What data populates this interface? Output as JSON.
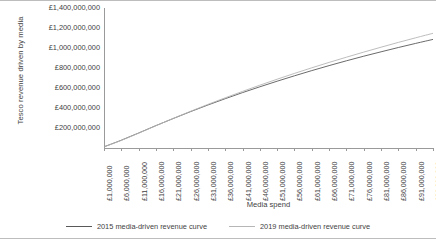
{
  "chart_data": {
    "type": "line",
    "title": "",
    "xlabel": "Media spend",
    "ylabel": "Tesco revenue driven by media",
    "grid": false,
    "legend_position": "bottom",
    "xlim": [
      1000000,
      96000000
    ],
    "ylim": [
      0,
      1400000000
    ],
    "x_tick_labels": [
      "£1,000,000",
      "£6,000,000",
      "£11,000,000",
      "£16,000,000",
      "£21,000,000",
      "£26,000,000",
      "£31,000,000",
      "£36,000,000",
      "£41,000,000",
      "£46,000,000",
      "£51,000,000",
      "£56,000,000",
      "£61,000,000",
      "£66,000,000",
      "£71,000,000",
      "£76,000,000",
      "£81,000,000",
      "£86,000,000",
      "£91,000,000",
      "£96,000,000"
    ],
    "x_tick_values": [
      1000000,
      6000000,
      11000000,
      16000000,
      21000000,
      26000000,
      31000000,
      36000000,
      41000000,
      46000000,
      51000000,
      56000000,
      61000000,
      66000000,
      71000000,
      76000000,
      81000000,
      86000000,
      91000000,
      96000000
    ],
    "y_tick_labels": [
      "£1,400,000,000",
      "£1,200,000,000",
      "£1,000,000,000",
      "£800,000,000",
      "£600,000,000",
      "£400,000,000",
      "£200,000,000"
    ],
    "y_tick_values": [
      1400000000,
      1200000000,
      1000000000,
      800000000,
      600000000,
      400000000,
      200000000
    ],
    "x": [
      1000000,
      6000000,
      11000000,
      16000000,
      21000000,
      26000000,
      31000000,
      36000000,
      41000000,
      46000000,
      51000000,
      56000000,
      61000000,
      66000000,
      71000000,
      76000000,
      81000000,
      86000000,
      91000000,
      96000000
    ],
    "series": [
      {
        "name": "2015 media-driven revenue curve",
        "color": "#595959",
        "values": [
          12000000,
          78000000,
          150000000,
          224000000,
          295000000,
          364000000,
          430000000,
          493000000,
          554000000,
          612000000,
          668000000,
          722000000,
          774000000,
          824000000,
          872000000,
          918000000,
          962000000,
          1005000000,
          1046000000,
          1086000000
        ]
      },
      {
        "name": "2019 media-driven revenue curve",
        "color": "#b6b6b6",
        "values": [
          11000000,
          76000000,
          148000000,
          223000000,
          296000000,
          367000000,
          436000000,
          502000000,
          566000000,
          628000000,
          688000000,
          746000000,
          802000000,
          856000000,
          908000000,
          959000000,
          1008000000,
          1056000000,
          1102000000,
          1147000000
        ]
      }
    ]
  },
  "axes": {
    "y_title": "Tesco revenue driven by media",
    "x_title": "Media spend"
  },
  "legend": {
    "items": [
      {
        "label": "2015 media-driven revenue curve",
        "color": "#595959"
      },
      {
        "label": "2019 media-driven revenue curve",
        "color": "#b6b6b6"
      }
    ]
  },
  "colors": {
    "series_2015": "#595959",
    "series_2019": "#b6b6b6",
    "axis": "#9a9a9a",
    "text": "#3f3f3f",
    "frame": "#bdbdbd",
    "background": "#ffffff"
  }
}
